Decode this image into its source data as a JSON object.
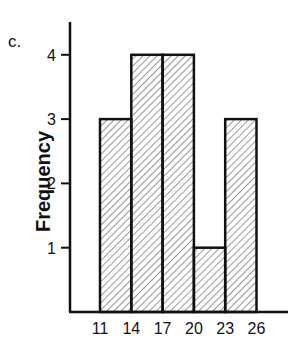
{
  "chart_data": {
    "type": "bar",
    "subtype": "histogram",
    "panel_label": "c.",
    "title": "",
    "xlabel": "",
    "ylabel": "Frequency",
    "bin_edges": [
      11,
      14,
      17,
      20,
      23,
      26
    ],
    "categories": [
      "11-14",
      "14-17",
      "17-20",
      "20-23",
      "23-26"
    ],
    "values": [
      3,
      4,
      4,
      1,
      3
    ],
    "x_tick_labels": [
      "11",
      "14",
      "17",
      "20",
      "23",
      "26"
    ],
    "y_tick_labels": [
      "1",
      "2",
      "3",
      "4"
    ],
    "ylim": [
      0,
      4.5
    ],
    "grid": false,
    "legend": null,
    "bar_fill": "diagonal-hatch",
    "colors": {
      "stroke": "#111111",
      "hatch": "#333333",
      "background": "#ffffff"
    }
  }
}
